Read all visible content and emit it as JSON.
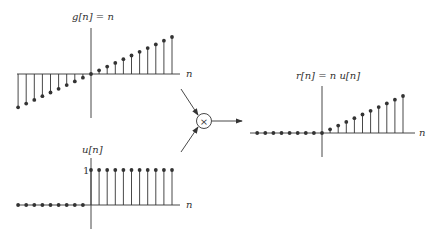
{
  "diagram": {
    "colors": {
      "line": "#333333",
      "dot": "#333333",
      "background": "#ffffff"
    },
    "plots": [
      {
        "id": "g",
        "label": "g[n] = n",
        "axis_label": "n",
        "origin": [
          91,
          74
        ],
        "spacing": 8.1,
        "unit": 3.7,
        "n_range": [
          -9,
          10
        ],
        "values": [
          -9,
          -8,
          -7,
          -6,
          -5,
          -4,
          -3,
          -2,
          -1,
          0,
          1,
          2,
          3,
          4,
          5,
          6,
          7,
          8,
          9,
          10
        ]
      },
      {
        "id": "u",
        "label": "u[n]",
        "axis_label": "n",
        "tick_label": "1",
        "origin": [
          91,
          205
        ],
        "spacing": 8.1,
        "unit": 35,
        "n_range": [
          -9,
          10
        ],
        "values": [
          0,
          0,
          0,
          0,
          0,
          0,
          0,
          0,
          0,
          1,
          1,
          1,
          1,
          1,
          1,
          1,
          1,
          1,
          1,
          1
        ]
      },
      {
        "id": "r",
        "label": "r[n] = n u[n]",
        "axis_label": "n",
        "origin": [
          322,
          133
        ],
        "spacing": 8.1,
        "unit": 3.7,
        "n_range": [
          -8,
          10
        ],
        "values": [
          0,
          0,
          0,
          0,
          0,
          0,
          0,
          0,
          0,
          1,
          2,
          3,
          4,
          5,
          6,
          7,
          8,
          9,
          10
        ]
      }
    ],
    "multiplier": {
      "symbol": "×",
      "center": [
        204,
        121
      ],
      "radius": 7
    }
  }
}
